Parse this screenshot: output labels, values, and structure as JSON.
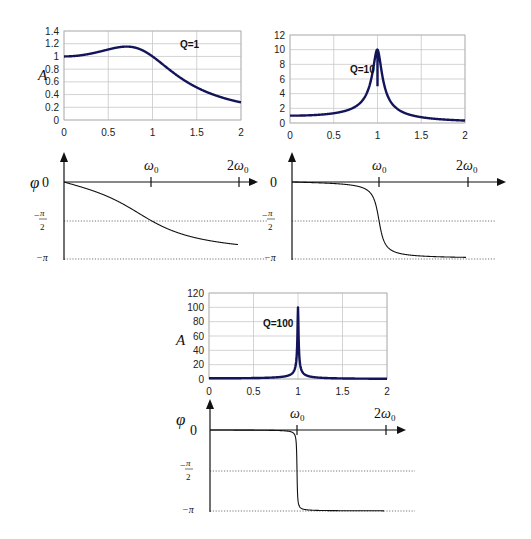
{
  "figure": {
    "panels": [
      {
        "id": "q1",
        "q_label": "Q=1",
        "amp_ylabel": "A",
        "phase_ylabel": "φ"
      },
      {
        "id": "q10",
        "q_label": "Q=10",
        "amp_ylabel": "",
        "phase_ylabel": ""
      },
      {
        "id": "q100",
        "q_label": "Q=100",
        "amp_ylabel": "A",
        "phase_ylabel": "φ"
      }
    ],
    "phase_ticks": {
      "zero": "0",
      "minus_half_pi_num": "π",
      "minus_half_pi_den": "2",
      "minus_half_pi_sign": "−",
      "minus_pi": "−π",
      "omega0": "ω",
      "omega0_sub": "0",
      "two_omega0": "2ω",
      "two_omega0_sub": "0"
    }
  },
  "chart_data": [
    {
      "type": "line",
      "title": "Q=1",
      "xlabel": "",
      "ylabel": "A",
      "xlim": [
        0,
        2
      ],
      "ylim": [
        0,
        1.4
      ],
      "xticks": [
        "0",
        "0.5",
        "1",
        "1.5",
        "2"
      ],
      "yticks": [
        "0",
        "0.2",
        "0.4",
        "0.6",
        "0.8",
        "1",
        "1.2",
        "1.4"
      ],
      "grid": true,
      "series": [
        {
          "name": "Q=1",
          "x": [
            0,
            0.2,
            0.4,
            0.6,
            0.7,
            0.8,
            1.0,
            1.2,
            1.4,
            1.6,
            1.8,
            2.0
          ],
          "values": [
            1.0,
            1.02,
            1.07,
            1.13,
            1.15,
            1.15,
            1.0,
            0.77,
            0.57,
            0.43,
            0.33,
            0.27
          ]
        }
      ]
    },
    {
      "type": "line",
      "title": "Q=10",
      "xlabel": "",
      "ylabel": "",
      "xlim": [
        0,
        2
      ],
      "ylim": [
        0,
        12
      ],
      "xticks": [
        "0",
        "0.5",
        "1",
        "1.5",
        "2"
      ],
      "yticks": [
        "0",
        "2",
        "4",
        "6",
        "8",
        "10",
        "12"
      ],
      "grid": true,
      "series": [
        {
          "name": "Q=10",
          "x": [
            0,
            0.3,
            0.5,
            0.7,
            0.8,
            0.9,
            0.95,
            1.0,
            1.05,
            1.1,
            1.2,
            1.3,
            1.5,
            1.7,
            2.0
          ],
          "values": [
            1.0,
            1.1,
            1.33,
            1.95,
            2.7,
            4.9,
            7.3,
            10.0,
            6.5,
            4.3,
            2.3,
            1.5,
            0.8,
            0.5,
            0.33
          ]
        }
      ]
    },
    {
      "type": "line",
      "title": "Q=100",
      "xlabel": "",
      "ylabel": "A",
      "xlim": [
        0,
        2
      ],
      "ylim": [
        0,
        120
      ],
      "xticks": [
        "0",
        "0.5",
        "1",
        "1.5",
        "2"
      ],
      "yticks": [
        "0",
        "20",
        "40",
        "60",
        "80",
        "100",
        "120"
      ],
      "grid": true,
      "series": [
        {
          "name": "Q=100",
          "x": [
            0,
            0.5,
            0.7,
            0.9,
            0.97,
            0.99,
            1.0,
            1.01,
            1.03,
            1.1,
            1.3,
            1.6,
            2.0
          ],
          "values": [
            1.0,
            1.3,
            2.0,
            5.2,
            16,
            45,
            100,
            45,
            16,
            4.8,
            1.4,
            0.6,
            0.33
          ]
        }
      ]
    },
    {
      "type": "line",
      "title": "Phase Q=1",
      "ylabel": "φ",
      "xticks": [
        "ω0",
        "2ω0"
      ],
      "yticks": [
        "0",
        "-π/2",
        "-π"
      ],
      "series": [
        {
          "name": "phase Q=1",
          "x": [
            0,
            0.5,
            1.0,
            1.5,
            2.0
          ],
          "values": [
            0,
            -0.59,
            -1.571,
            -2.27,
            -2.41
          ]
        }
      ]
    },
    {
      "type": "line",
      "title": "Phase Q=10",
      "ylabel": "φ",
      "xticks": [
        "ω0",
        "2ω0"
      ],
      "yticks": [
        "0",
        "-π/2",
        "-π"
      ],
      "series": [
        {
          "name": "phase Q=10",
          "x": [
            0,
            0.5,
            0.9,
            1.0,
            1.1,
            1.5,
            2.0
          ],
          "values": [
            0,
            -0.07,
            -0.44,
            -1.571,
            -2.7,
            -3.01,
            -3.08
          ]
        }
      ]
    },
    {
      "type": "line",
      "title": "Phase Q=100",
      "ylabel": "φ",
      "xticks": [
        "ω0",
        "2ω0"
      ],
      "yticks": [
        "0",
        "-π/2",
        "-π"
      ],
      "series": [
        {
          "name": "phase Q=100",
          "x": [
            0,
            0.9,
            0.99,
            1.0,
            1.01,
            1.1,
            2.0
          ],
          "values": [
            0,
            -0.05,
            -0.46,
            -1.571,
            -2.68,
            -3.09,
            -3.13
          ]
        }
      ]
    }
  ]
}
